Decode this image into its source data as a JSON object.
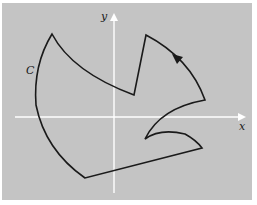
{
  "figure": {
    "background_color": "#c4c4c4",
    "axis_color": "#ffffff",
    "curve_color": "#1a1a1a",
    "axes": {
      "x_label": "x",
      "y_label": "y"
    },
    "curve": {
      "label": "C",
      "orientation": "counterclockwise",
      "description": "Closed piecewise-smooth curve with cusps, oriented by an arrow"
    }
  }
}
